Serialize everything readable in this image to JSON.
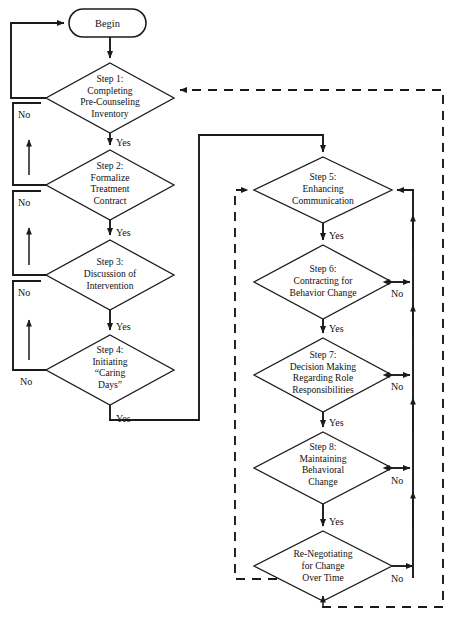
{
  "diagram": {
    "start_node": {
      "label": "Begin",
      "shape": "rounded-capsule"
    },
    "decisions": [
      {
        "id": "step1",
        "lines": [
          "Step 1:",
          "Completing",
          "Pre-Counseling",
          "Inventory"
        ],
        "yes_label": "Yes",
        "no_label": "No"
      },
      {
        "id": "step2",
        "lines": [
          "Step 2:",
          "Formalize",
          "Treatment",
          "Contract"
        ],
        "yes_label": "Yes",
        "no_label": "No"
      },
      {
        "id": "step3",
        "lines": [
          "Step 3:",
          "Discussion of",
          "Intervention"
        ],
        "yes_label": "Yes",
        "no_label": "No"
      },
      {
        "id": "step4",
        "lines": [
          "Step 4:",
          "Initiating",
          "“Caring",
          "Days”"
        ],
        "yes_label": "Yes",
        "no_label": "No"
      },
      {
        "id": "step5",
        "lines": [
          "Step 5:",
          "Enhancing",
          "Communication"
        ],
        "yes_label": "Yes",
        "no_label": ""
      },
      {
        "id": "step6",
        "lines": [
          "Step 6:",
          "Contracting for",
          "Behavior Change"
        ],
        "yes_label": "Yes",
        "no_label": "No"
      },
      {
        "id": "step7",
        "lines": [
          "Step 7:",
          "Decision Making",
          "Regarding  Role",
          "Responsibilities"
        ],
        "yes_label": "Yes",
        "no_label": "No"
      },
      {
        "id": "step8",
        "lines": [
          "Step 8:",
          "Maintaining",
          "Behavioral",
          "Change"
        ],
        "yes_label": "Yes",
        "no_label": "No"
      },
      {
        "id": "renegotiate",
        "lines": [
          "Re-Negotiating",
          "for Change",
          "Over Time"
        ],
        "yes_label": "",
        "no_label": "No"
      }
    ],
    "colors": {
      "stroke": "#1a1a1a",
      "fill": "#ffffff",
      "text": "#111111",
      "background": "#ffffff"
    }
  }
}
